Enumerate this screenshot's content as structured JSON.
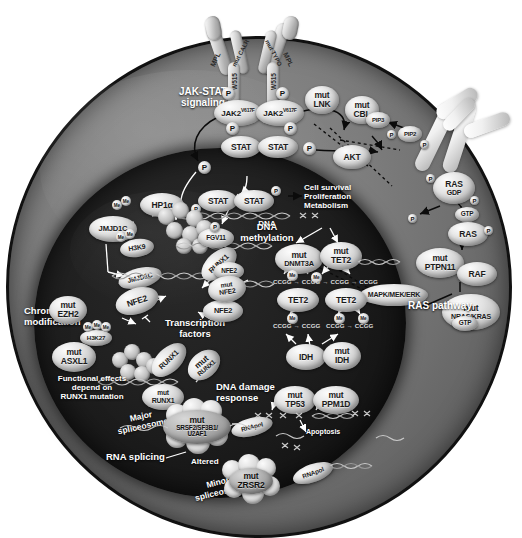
{
  "figure": {
    "background_color": "#ffffff",
    "cell_color": "#7d7d7d",
    "nucleus_color": "#1c1c1c"
  },
  "receptor": {
    "left_arm_label": "MPL",
    "right_arm_label": "MPL",
    "mut_calr": "mut CALR",
    "mut_typo": "mut TYPO",
    "w515_left": "W515",
    "w515_right": "W515"
  },
  "pathways": {
    "jak_stat": "JAK-STAT\nsignaling",
    "jak_stat_line1": "JAK-STAT",
    "jak_stat_line2": "signaling",
    "ras": "RAS pathway",
    "dna_methylation_line1": "DNA",
    "dna_methylation_line2": "methylation",
    "chromatin_line1": "Chromatin",
    "chromatin_line2": "modification",
    "transcription_line1": "Transcription",
    "transcription_line2": "factors",
    "damage_line1": "DNA damage",
    "damage_line2": "response",
    "rna_splicing": "RNA splicing",
    "major_spliceosome_line1": "Major",
    "major_spliceosome_line2": "spliceosome",
    "minor_spliceosome_line1": "Minor",
    "minor_spliceosome_line2": "spliceosome",
    "altered": "Altered",
    "apoptosis": "Apoptosis",
    "dna_label": "DNA",
    "outcome_line1": "Cell survival",
    "outcome_line2": "Proliferation",
    "outcome_line3": "Metabolism",
    "runx1_note_line1": "Functional effects",
    "runx1_note_line2": "depend on",
    "runx1_note_line3": "RUNX1 mutation"
  },
  "nodes": {
    "jak2_left": "JAK2",
    "jak2_left_sup": "V617F",
    "jak2_right": "JAK2",
    "jak2_right_sup": "V617F",
    "stat_top_left": "STAT",
    "stat_top_right": "STAT",
    "stat_dna_left": "STAT",
    "stat_dna_right": "STAT",
    "mut_lnk_1": "mut",
    "mut_lnk_2": "LNK",
    "mut_cbl_1": "mut",
    "mut_cbl_2": "CBL",
    "akt": "AKT",
    "pip3": "PIP3",
    "pip2": "PIP2",
    "ras_gdp_1": "RAS",
    "ras_gdp_2": "GDP",
    "gtp_free": "GTP",
    "ras_gtp": "RAS",
    "mut_ptpn11_1": "mut",
    "mut_ptpn11_2": "PTPN11",
    "raf": "RAF",
    "mapk": "MAPK/MEK/ERK",
    "mut_nras_1": "mut",
    "mut_nras_2": "NRAS/KRAS",
    "mut_nras_3": "GTP",
    "mut_dnmt3a_1": "mut",
    "mut_dnmt3a_2": "DNMT3A",
    "mut_tet2_1": "mut",
    "mut_tet2_2": "TET2",
    "tet2_a": "TET2",
    "tet2_b": "TET2",
    "idh": "IDH",
    "mut_idh_1": "mut",
    "mut_idh_2": "IDH",
    "mut_tp53_1": "mut",
    "mut_tp53_2": "TP53",
    "mut_ppm1d_1": "mut",
    "mut_ppm1d_2": "PPM1D",
    "jmjd1c": "JMJD1C",
    "jmjd1c_2": "JMJD1C",
    "hp1a": "HP1α",
    "h3k9": "H3K9",
    "h3k27": "H3K27",
    "mut_ezh2_1": "mut",
    "mut_ezh2_2": "EZH2",
    "mut_asxl1_1": "mut",
    "mut_asxl1_2": "ASXL1",
    "fgv11": "FGV11",
    "runx1_a": "RUNX1",
    "runx1_b": "RUNX1",
    "mut_runx1_1": "mut",
    "mut_runx1_2": "RUNX1",
    "runx1_low_1": "mut",
    "runx1_low_2": "RUNX1",
    "nfe2_a": "NFE2",
    "nfe2_b": "NFE2",
    "nfe2_c": "NFE2",
    "mut_nfe2_1": "mut",
    "mut_nfe2_2": "NFE2",
    "mut_srsf2_1": "mut",
    "mut_srsf2_2": "SRSF2/SF3B1/",
    "mut_srsf2_3": "U2AF1",
    "mut_zrsr2_1": "mut",
    "mut_zrsr2_2": "ZRSR2",
    "rnapol_a": "RNApol",
    "rnapol_b": "RNApol",
    "p": "P",
    "me": "Me",
    "ccgg": "CCGG"
  },
  "dna_seq": {
    "methylation_row1": [
      "CCGG",
      "CCGG",
      "CCGG",
      "CCGG"
    ],
    "methylation_row2": [
      "CCGG",
      "CCGG",
      "CCGG",
      "CCGG"
    ]
  }
}
